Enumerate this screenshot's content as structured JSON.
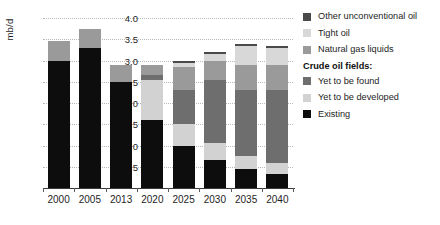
{
  "chart_data": {
    "type": "bar",
    "title": "",
    "xlabel": "",
    "ylabel": "mb/d",
    "ylim": [
      0,
      4.0
    ],
    "yticks": [
      "0.5",
      "1.0",
      "1.5",
      "2.0",
      "2.5",
      "3.0",
      "3.5",
      "4.0"
    ],
    "ytick_values": [
      0.5,
      1.0,
      1.5,
      2.0,
      2.5,
      3.0,
      3.5,
      4.0
    ],
    "grid": true,
    "stacked": true,
    "legend_position": "right",
    "categories": [
      "2000",
      "2005",
      "2013",
      "2020",
      "2025",
      "2030",
      "2035",
      "2040"
    ],
    "series": [
      {
        "name": "Existing",
        "color": "#0d0d0d",
        "values": [
          3.0,
          3.3,
          2.5,
          1.6,
          1.0,
          0.65,
          0.45,
          0.33
        ]
      },
      {
        "name": "Yet to be developed",
        "color": "#d2d2d2",
        "values": [
          0.0,
          0.0,
          0.0,
          0.95,
          0.5,
          0.4,
          0.3,
          0.27
        ]
      },
      {
        "name": "Yet to be found",
        "color": "#6e6e6e",
        "values": [
          0.0,
          0.0,
          0.0,
          0.1,
          0.8,
          1.5,
          1.55,
          1.7
        ]
      },
      {
        "name": "Natural gas liquids",
        "color": "#9a9a9a",
        "values": [
          0.45,
          0.45,
          0.4,
          0.25,
          0.55,
          0.45,
          0.6,
          0.6
        ]
      },
      {
        "name": "Tight oil",
        "color": "#d8d8d8",
        "values": [
          0.0,
          0.0,
          0.0,
          0.0,
          0.1,
          0.15,
          0.45,
          0.4
        ]
      },
      {
        "name": "Other unconventional oil",
        "color": "#4a4a4a",
        "values": [
          0.0,
          0.0,
          0.0,
          0.0,
          0.05,
          0.05,
          0.05,
          0.05
        ]
      }
    ],
    "totals": [
      3.45,
      3.75,
      2.9,
      2.9,
      3.0,
      3.2,
      3.4,
      3.35
    ]
  },
  "legend": {
    "top_entries": [
      {
        "label": "Other unconventional oil",
        "color": "#4a4a4a"
      },
      {
        "label": "Tight oil",
        "color": "#d8d8d8"
      },
      {
        "label": "Natural gas liquids",
        "color": "#9a9a9a"
      }
    ],
    "group_heading": "Crude oil fields:",
    "group_entries": [
      {
        "label": "Yet to be found",
        "color": "#6e6e6e"
      },
      {
        "label": "Yet to be developed",
        "color": "#d2d2d2"
      },
      {
        "label": "Existing",
        "color": "#0d0d0d"
      }
    ]
  }
}
